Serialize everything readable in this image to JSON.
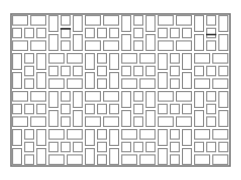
{
  "diagram": {
    "type": "tile-pattern",
    "frame": {
      "x": 11,
      "y": 14,
      "width": 219,
      "height": 152
    },
    "grid": {
      "columns": 6,
      "rows": 4,
      "block_width": 36.4,
      "block_height": 38,
      "origin_x": 11,
      "origin_y": 14
    },
    "block_layout": "checkerboard",
    "block_types": {
      "H": "horizontal: 2 long bricks / 3 short bricks / 2 long bricks",
      "V": "vertical: rotated version of H"
    },
    "blocks": [
      [
        "H",
        "V",
        "H",
        "V",
        "H",
        "V"
      ],
      [
        "V",
        "H",
        "V",
        "H",
        "V",
        "H"
      ],
      [
        "H",
        "V",
        "H",
        "V",
        "H",
        "V"
      ],
      [
        "V",
        "H",
        "V",
        "H",
        "V",
        "H"
      ]
    ],
    "marks": [
      {
        "col": 1,
        "row": 0,
        "position": "upper",
        "color": "#333333"
      },
      {
        "col": 5,
        "row": 0,
        "position": "middle",
        "color": "#333333"
      }
    ],
    "colors": {
      "background": "#ffffff",
      "stroke": "#8a8a8a",
      "frame": "#7a7a7a"
    }
  }
}
